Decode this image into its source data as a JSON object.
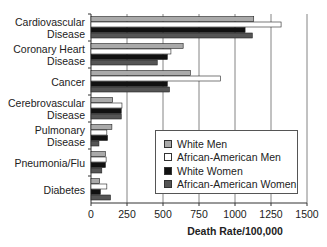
{
  "chart_data": {
    "type": "bar",
    "orientation": "horizontal",
    "title": "",
    "xlabel": "Death Rate/100,000",
    "ylabel": "",
    "xlim": [
      0,
      1500
    ],
    "xticks": [
      0,
      250,
      500,
      750,
      1000,
      1250,
      1500
    ],
    "grid": "vertical",
    "legend_position": "lower right (inside plot)",
    "categories": [
      "Cardiovascular Disease",
      "Coronary Heart Disease",
      "Cancer",
      "Cerebrovascular Disease",
      "Pulmonary Disease",
      "Pneumonia/Flu",
      "Diabetes"
    ],
    "category_lines": [
      [
        "Cardiovascular",
        "Disease"
      ],
      [
        "Coronary Heart",
        "Disease"
      ],
      [
        "Cancer"
      ],
      [
        "Cerebrovascular",
        "Disease"
      ],
      [
        "Pulmonary",
        "Disease"
      ],
      [
        "Pneumonia/Flu"
      ],
      [
        "Diabetes"
      ]
    ],
    "series": [
      {
        "name": "White Men",
        "color": "#aaaaaa",
        "values": [
          1130,
          640,
          690,
          150,
          145,
          100,
          60
        ]
      },
      {
        "name": "African-American Men",
        "color": "#ffffff",
        "values": [
          1320,
          555,
          900,
          215,
          110,
          105,
          110
        ]
      },
      {
        "name": "White Women",
        "color": "#111111",
        "values": [
          1070,
          530,
          530,
          210,
          115,
          100,
          65
        ]
      },
      {
        "name": "African-American Women",
        "color": "#555555",
        "values": [
          1120,
          460,
          545,
          210,
          55,
          75,
          135
        ]
      }
    ]
  }
}
